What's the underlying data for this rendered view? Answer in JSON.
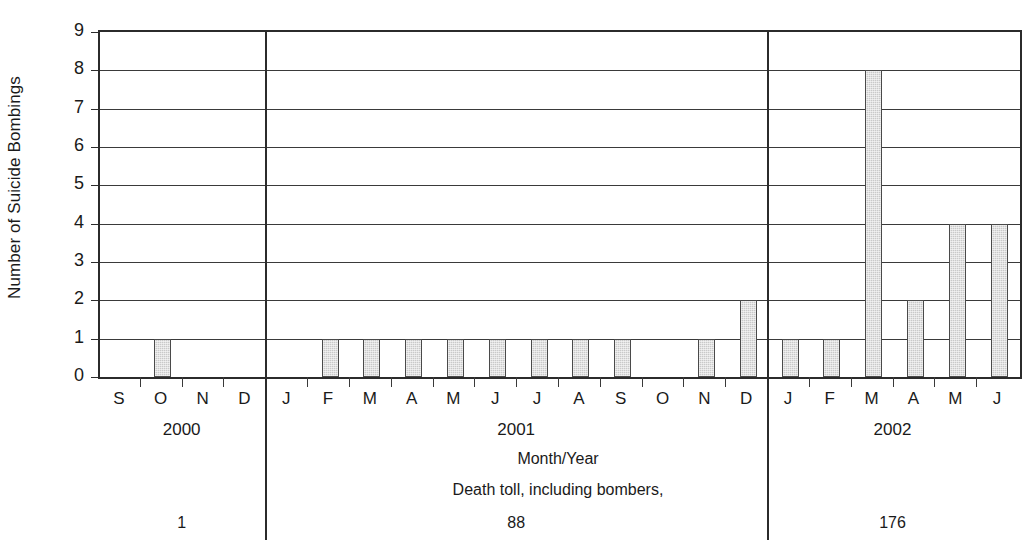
{
  "chart_data": {
    "type": "bar",
    "title": "",
    "subtitle": "",
    "xlabel": "Month/Year",
    "ylabel": "Number of Suicide Bombings",
    "ylim": [
      0,
      9
    ],
    "yticks": [
      0,
      1,
      2,
      3,
      4,
      5,
      6,
      7,
      8,
      9
    ],
    "grid": true,
    "legend": null,
    "bar_color": "#c9c9c9",
    "bar_edge_color": "#4a4a4a",
    "axis_color": "#2b2b2b",
    "categories": [
      "S",
      "O",
      "N",
      "D",
      "J",
      "F",
      "M",
      "A",
      "M",
      "J",
      "J",
      "A",
      "S",
      "O",
      "N",
      "D",
      "J",
      "F",
      "M",
      "A",
      "M",
      "J"
    ],
    "values": [
      0,
      1,
      0,
      0,
      0,
      1,
      1,
      1,
      1,
      1,
      1,
      1,
      1,
      0,
      1,
      2,
      1,
      1,
      8,
      2,
      4,
      4
    ],
    "groups": [
      {
        "year_label": "2000",
        "months": [
          "S",
          "O",
          "N",
          "D"
        ],
        "values": [
          0,
          1,
          0,
          0
        ],
        "death_toll": "1"
      },
      {
        "year_label": "2001",
        "months": [
          "J",
          "F",
          "M",
          "A",
          "M",
          "J",
          "J",
          "A",
          "S",
          "O",
          "N",
          "D"
        ],
        "values": [
          0,
          1,
          1,
          1,
          1,
          1,
          1,
          1,
          1,
          0,
          1,
          2
        ],
        "death_toll": "88"
      },
      {
        "year_label": "2002",
        "months": [
          "J",
          "F",
          "M",
          "A",
          "M",
          "J"
        ],
        "values": [
          1,
          1,
          8,
          2,
          4,
          4
        ],
        "death_toll": "176"
      }
    ],
    "annotations": {
      "death_toll_caption": "Death toll, including bombers,",
      "death_toll_values": [
        "1",
        "88",
        "176"
      ]
    }
  }
}
